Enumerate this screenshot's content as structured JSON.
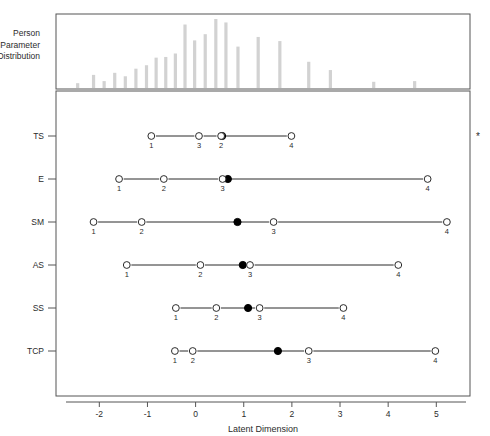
{
  "figure": {
    "xlabel": "Latent Dimension",
    "side_label_lines": [
      "Person",
      "Parameter",
      "Distribution"
    ],
    "significance_marker": "*"
  },
  "chart_data": {
    "type": "scatter",
    "title": "",
    "xlabel": "Latent Dimension",
    "ylabel": "",
    "xlim": [
      -2.9,
      5.7
    ],
    "xticks": [
      -2,
      -1,
      0,
      1,
      2,
      3,
      4,
      5
    ],
    "xtick_labels": [
      "-2",
      "-1",
      "0",
      "1",
      "2",
      "3",
      "4",
      "5"
    ],
    "grid": false,
    "legend": null,
    "panels": [
      {
        "name": "person-parameter-distribution",
        "type": "bar",
        "label_lines": [
          "Person",
          "Parameter",
          "Distribution"
        ],
        "ylim": [
          0,
          1
        ],
        "bars": [
          {
            "x": -2.45,
            "height": 0.07
          },
          {
            "x": -2.12,
            "height": 0.19
          },
          {
            "x": -1.9,
            "height": 0.1
          },
          {
            "x": -1.68,
            "height": 0.22
          },
          {
            "x": -1.46,
            "height": 0.17
          },
          {
            "x": -1.24,
            "height": 0.28
          },
          {
            "x": -1.02,
            "height": 0.33
          },
          {
            "x": -0.82,
            "height": 0.44
          },
          {
            "x": -0.62,
            "height": 0.45
          },
          {
            "x": -0.42,
            "height": 0.5
          },
          {
            "x": -0.22,
            "height": 0.92
          },
          {
            "x": -0.02,
            "height": 0.69
          },
          {
            "x": 0.2,
            "height": 0.78
          },
          {
            "x": 0.42,
            "height": 1.0
          },
          {
            "x": 0.63,
            "height": 0.95
          },
          {
            "x": 0.88,
            "height": 0.6
          },
          {
            "x": 1.3,
            "height": 0.74
          },
          {
            "x": 1.75,
            "height": 0.68
          },
          {
            "x": 2.35,
            "height": 0.38
          },
          {
            "x": 2.8,
            "height": 0.26
          },
          {
            "x": 3.7,
            "height": 0.09
          },
          {
            "x": 4.55,
            "height": 0.1
          }
        ]
      }
    ],
    "items": [
      {
        "label": "TS",
        "thresholds": [
          {
            "order": "1",
            "x": -0.92
          },
          {
            "order": "3",
            "x": 0.07
          },
          {
            "order": "2",
            "x": 0.53
          },
          {
            "order": "4",
            "x": 1.99
          }
        ],
        "location": 0.55,
        "flagged": true
      },
      {
        "label": "E",
        "thresholds": [
          {
            "order": "1",
            "x": -1.59
          },
          {
            "order": "2",
            "x": -0.66
          },
          {
            "order": "3",
            "x": 0.56
          },
          {
            "order": "4",
            "x": 4.82
          }
        ],
        "location": 0.67,
        "flagged": false
      },
      {
        "label": "SM",
        "thresholds": [
          {
            "order": "1",
            "x": -2.12
          },
          {
            "order": "2",
            "x": -1.12
          },
          {
            "order": "3",
            "x": 1.62
          },
          {
            "order": "4",
            "x": 5.22
          }
        ],
        "location": 0.87,
        "flagged": false
      },
      {
        "label": "AS",
        "thresholds": [
          {
            "order": "1",
            "x": -1.43
          },
          {
            "order": "2",
            "x": 0.1
          },
          {
            "order": "3",
            "x": 1.13
          },
          {
            "order": "4",
            "x": 4.21
          }
        ],
        "location": 0.98,
        "flagged": false
      },
      {
        "label": "SS",
        "thresholds": [
          {
            "order": "1",
            "x": -0.41
          },
          {
            "order": "2",
            "x": 0.43
          },
          {
            "order": "3",
            "x": 1.33
          },
          {
            "order": "4",
            "x": 3.07
          }
        ],
        "location": 1.09,
        "flagged": false
      },
      {
        "label": "TCP",
        "thresholds": [
          {
            "order": "1",
            "x": -0.43
          },
          {
            "order": "2",
            "x": -0.06
          },
          {
            "order": "3",
            "x": 2.35
          },
          {
            "order": "4",
            "x": 4.98
          }
        ],
        "location": 1.71,
        "flagged": false
      }
    ]
  }
}
